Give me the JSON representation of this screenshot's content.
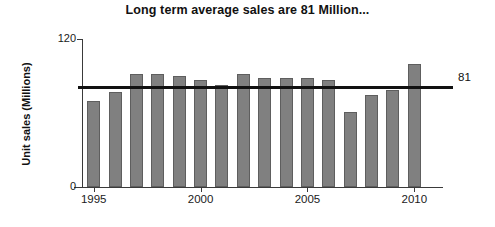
{
  "chart_data": {
    "type": "bar",
    "title": "Long term average sales are 81 Million...",
    "xlabel": "",
    "ylabel": "Unit sales (Millions)",
    "ylim": [
      0,
      120
    ],
    "ytick_labels": [
      "0",
      "120"
    ],
    "xlim": [
      1994.5,
      2010.5
    ],
    "xtick_labels": [
      "1995",
      "2000",
      "2005",
      "2010"
    ],
    "xticks": [
      1995,
      2000,
      2005,
      2010
    ],
    "grid": false,
    "legend": false,
    "categories": [
      1995,
      1996,
      1997,
      1998,
      1999,
      2000,
      2001,
      2002,
      2003,
      2004,
      2005,
      2006,
      2007,
      2008,
      2009,
      2010
    ],
    "values": [
      70,
      77,
      92,
      92,
      90,
      87,
      83,
      92,
      88,
      88,
      88,
      87,
      61,
      75,
      79,
      100
    ],
    "bar_color": "#808080",
    "bar_edge_color": "#5e5e5e",
    "annotations": [
      {
        "type": "hline",
        "name": "long-term-average-line",
        "value": 81,
        "label": "81",
        "color": "#111111"
      }
    ]
  },
  "chart": {
    "title": "Long term average sales are 81 Million...",
    "y_axis": {
      "title": "Unit sales (Millions)",
      "top_label": "120",
      "zero_label": "0"
    },
    "x_axis": {
      "labels": [
        "1995",
        "2000",
        "2005",
        "2010"
      ]
    },
    "average_label": "81"
  }
}
